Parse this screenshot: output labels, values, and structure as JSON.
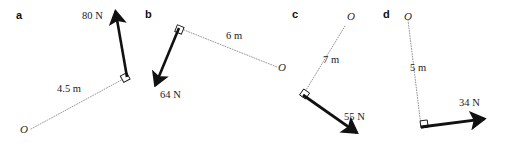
{
  "figure": {
    "width": 505,
    "height": 146,
    "background_color": "#ffffff",
    "vector_color": "#111111",
    "dotted_color": "#9a9a9a"
  },
  "panels": [
    {
      "letter": "a",
      "letter_pos": {
        "x": 16,
        "y": 10
      },
      "origin_label": "O",
      "origin_label_pos": {
        "x": 20,
        "y": 124
      },
      "origin_point": {
        "x": 31,
        "y": 129
      },
      "pivot_corner": {
        "x": 127,
        "y": 77
      },
      "distance_label": "4.5 m",
      "distance_label_pos": {
        "x": 57,
        "y": 84
      },
      "force_label": "80 N",
      "force_label_pos": {
        "x": 82,
        "y": 11
      },
      "force_tail": {
        "x": 127,
        "y": 77
      },
      "force_tip": {
        "x": 114,
        "y": 7
      }
    },
    {
      "letter": "b",
      "letter_pos": {
        "x": 145,
        "y": 9
      },
      "origin_label": "O",
      "origin_label_pos": {
        "x": 278,
        "y": 62
      },
      "origin_point": {
        "x": 277,
        "y": 67
      },
      "pivot_corner": {
        "x": 179,
        "y": 28
      },
      "distance_label": "6 m",
      "distance_label_pos": {
        "x": 226,
        "y": 31
      },
      "force_label": "64 N",
      "force_label_pos": {
        "x": 160,
        "y": 90
      },
      "force_tail": {
        "x": 179,
        "y": 28
      },
      "force_tip": {
        "x": 153,
        "y": 91
      }
    },
    {
      "letter": "c",
      "letter_pos": {
        "x": 292,
        "y": 9
      },
      "origin_label": "O",
      "origin_label_pos": {
        "x": 347,
        "y": 19
      },
      "origin_point": {
        "x": 345,
        "y": 26
      },
      "pivot_corner": {
        "x": 303,
        "y": 95
      },
      "distance_label": "7 m",
      "distance_label_pos": {
        "x": 323,
        "y": 55
      },
      "force_label": "55 N",
      "force_label_pos": {
        "x": 344,
        "y": 112
      },
      "force_tail": {
        "x": 303,
        "y": 95
      },
      "force_tip": {
        "x": 363,
        "y": 137
      }
    },
    {
      "letter": "d",
      "letter_pos": {
        "x": 383,
        "y": 9
      },
      "origin_label": "O",
      "origin_label_pos": {
        "x": 404,
        "y": 11
      },
      "origin_point": {
        "x": 408,
        "y": 20
      },
      "pivot_corner": {
        "x": 421,
        "y": 126
      },
      "distance_label": "5 m",
      "distance_label_pos": {
        "x": 410,
        "y": 63
      },
      "force_label": "34 N",
      "force_label_pos": {
        "x": 459,
        "y": 98
      },
      "force_tail": {
        "x": 421,
        "y": 127
      },
      "force_tip": {
        "x": 491,
        "y": 118
      }
    }
  ]
}
